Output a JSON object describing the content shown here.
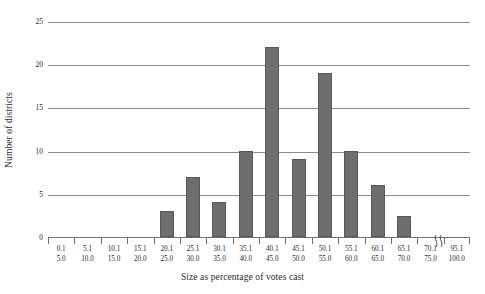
{
  "chart_data": {
    "type": "bar",
    "title": "",
    "xlabel": "Size as percentage of votes cast",
    "ylabel": "Number of districts",
    "categories": [
      "0.1\n5.0",
      "5.1\n10.0",
      "10.1\n15.0",
      "15.1\n20.0",
      "20.1\n25.0",
      "25.1\n30.0",
      "30.1\n35.0",
      "35.1\n40.0",
      "40.1\n45.0",
      "45.1\n50.0",
      "50.1\n55.0",
      "55.1\n60.0",
      "60.1\n65.0",
      "65.1\n70.0",
      "70.1\n75.0",
      "95.1\n100.0"
    ],
    "values": [
      0,
      0,
      0,
      0,
      3,
      7,
      4,
      10,
      22,
      9,
      19,
      10,
      6,
      2.4,
      0,
      0
    ],
    "ylim": [
      0,
      25
    ],
    "yticks": [
      0,
      5,
      10,
      15,
      20,
      25
    ],
    "grid": true,
    "legend": null,
    "axis_break_between": [
      "70.1\n75.0",
      "95.1\n100.0"
    ],
    "bar_color": "#6e6e70",
    "grid_color": "#8c8c90"
  },
  "axes": {
    "y_tick_labels": [
      "0",
      "5",
      "10",
      "15",
      "20",
      "25"
    ],
    "y_title": "Number of districts",
    "x_title": "Size as percentage of votes cast",
    "x_tick_labels": [
      {
        "lower": "0.1",
        "upper": "5.0"
      },
      {
        "lower": "5.1",
        "upper": "10.0"
      },
      {
        "lower": "10.1",
        "upper": "15.0"
      },
      {
        "lower": "15.1",
        "upper": "20.0"
      },
      {
        "lower": "20.1",
        "upper": "25.0"
      },
      {
        "lower": "25.1",
        "upper": "30.0"
      },
      {
        "lower": "30.1",
        "upper": "35.0"
      },
      {
        "lower": "35.1",
        "upper": "40.0"
      },
      {
        "lower": "40.1",
        "upper": "45.0"
      },
      {
        "lower": "45.1",
        "upper": "50.0"
      },
      {
        "lower": "50.1",
        "upper": "55.0"
      },
      {
        "lower": "55.1",
        "upper": "60.0"
      },
      {
        "lower": "60.1",
        "upper": "65.0"
      },
      {
        "lower": "65.1",
        "upper": "70.0"
      },
      {
        "lower": "70.1",
        "upper": "75.0"
      },
      {
        "lower": "95.1",
        "upper": "100.0"
      }
    ]
  }
}
